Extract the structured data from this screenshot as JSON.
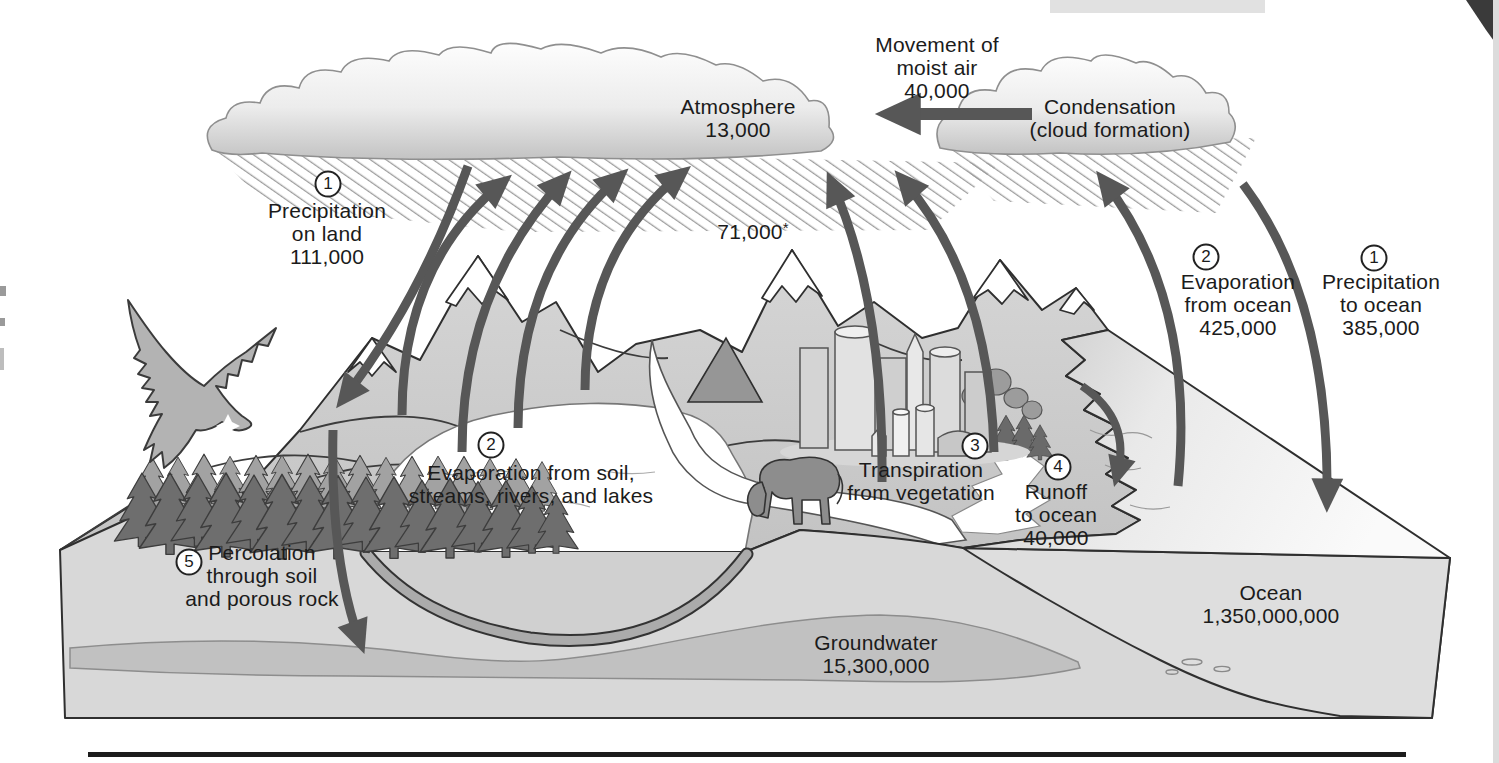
{
  "figure": {
    "labels": {
      "atmosphere": {
        "text": "Atmosphere\n13,000"
      },
      "moist_air": {
        "text": "Movement of\nmoist air\n40,000"
      },
      "condensation": {
        "text": "Condensation\n(cloud formation)"
      },
      "precipitation_on_land": {
        "num": "1",
        "text": "Precipitation\non land\n111,000"
      },
      "evaporation_rising_total": {
        "value": "71,000",
        "asterisk": "*"
      },
      "evaporation_from_ocean": {
        "num": "2",
        "text": "Evaporation\nfrom ocean\n425,000"
      },
      "precipitation_to_ocean": {
        "num": "1",
        "text": "Precipitation\nto ocean\n385,000"
      },
      "evaporation_from_soil": {
        "num": "2",
        "text": "Evaporation from soil,\nstreams, rivers, and lakes"
      },
      "transpiration": {
        "num": "3",
        "text": "Transpiration\nfrom vegetation"
      },
      "runoff": {
        "num": "4",
        "text": "Runoff\nto ocean\n40,000"
      },
      "percolation": {
        "num": "5",
        "text": "Percolation\nthrough soil\nand porous rock"
      },
      "groundwater": {
        "text": "Groundwater\n15,300,000"
      },
      "ocean": {
        "text": "Ocean\n1,350,000,000"
      }
    },
    "colors": {
      "arrow": "#575757",
      "outline": "#2f2f2f",
      "text": "#1b1b1b",
      "cloud_shade": "#c6c6c6"
    }
  }
}
